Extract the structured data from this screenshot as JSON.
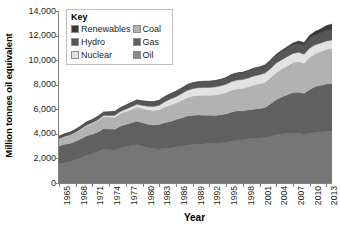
{
  "chart_data": {
    "type": "area",
    "stacked": true,
    "title": "",
    "xlabel": "Year",
    "ylabel": "Million tonnes oil equivalent",
    "xlim": [
      1965,
      2014
    ],
    "ylim": [
      0,
      14000
    ],
    "ytick_step": 2000,
    "ytick_labels": [
      "0",
      "2,000",
      "4,000",
      "6,000",
      "8,000",
      "10,000",
      "12,000",
      "14,000"
    ],
    "ytick_values": [
      0,
      2000,
      4000,
      6000,
      8000,
      10000,
      12000,
      14000
    ],
    "xtick_labels": [
      "1965",
      "1968",
      "1971",
      "1974",
      "1977",
      "1980",
      "1983",
      "1986",
      "1989",
      "1992",
      "1995",
      "1998",
      "2001",
      "2004",
      "2007",
      "2010",
      "2013"
    ],
    "xtick_values": [
      1965,
      1968,
      1971,
      1974,
      1977,
      1980,
      1983,
      1986,
      1989,
      1992,
      1995,
      1998,
      2001,
      2004,
      2007,
      2010,
      2013
    ],
    "grid": false,
    "legend_position": "top-left-inside",
    "x": [
      1965,
      1966,
      1967,
      1968,
      1969,
      1970,
      1971,
      1972,
      1973,
      1974,
      1975,
      1976,
      1977,
      1978,
      1979,
      1980,
      1981,
      1982,
      1983,
      1984,
      1985,
      1986,
      1987,
      1988,
      1989,
      1990,
      1991,
      1992,
      1993,
      1994,
      1995,
      1996,
      1997,
      1998,
      1999,
      2000,
      2001,
      2002,
      2003,
      2004,
      2005,
      2006,
      2007,
      2008,
      2009,
      2010,
      2011,
      2012,
      2013,
      2014
    ],
    "series": [
      {
        "name": "Oil",
        "color": "#767676",
        "stack_order": 1,
        "values": [
          1530,
          1650,
          1760,
          1900,
          2060,
          2250,
          2380,
          2540,
          2750,
          2710,
          2680,
          2860,
          2960,
          3060,
          3120,
          2980,
          2860,
          2780,
          2760,
          2810,
          2820,
          2930,
          2990,
          3080,
          3130,
          3160,
          3170,
          3210,
          3200,
          3260,
          3310,
          3400,
          3490,
          3520,
          3600,
          3640,
          3670,
          3700,
          3780,
          3930,
          3990,
          4030,
          4070,
          4040,
          3960,
          4070,
          4100,
          4150,
          4190,
          4220
        ]
      },
      {
        "name": "Coal",
        "color": "#606060",
        "stack_order": 2,
        "values": [
          1480,
          1500,
          1460,
          1500,
          1550,
          1600,
          1590,
          1610,
          1670,
          1690,
          1700,
          1760,
          1810,
          1840,
          1910,
          1930,
          1930,
          1950,
          2000,
          2100,
          2190,
          2230,
          2300,
          2370,
          2390,
          2380,
          2350,
          2310,
          2290,
          2300,
          2330,
          2370,
          2390,
          2360,
          2340,
          2370,
          2400,
          2450,
          2680,
          2860,
          3010,
          3160,
          3290,
          3350,
          3340,
          3540,
          3760,
          3800,
          3870,
          3880
        ]
      },
      {
        "name": "Gas",
        "color": "#b2b2b2",
        "stack_order": 3,
        "values": [
          570,
          610,
          650,
          700,
          760,
          820,
          880,
          930,
          970,
          980,
          980,
          1030,
          1050,
          1090,
          1150,
          1160,
          1170,
          1180,
          1200,
          1290,
          1340,
          1360,
          1430,
          1490,
          1560,
          1590,
          1630,
          1630,
          1670,
          1690,
          1720,
          1800,
          1800,
          1840,
          1890,
          1980,
          2010,
          2060,
          2130,
          2210,
          2280,
          2350,
          2440,
          2490,
          2440,
          2620,
          2690,
          2760,
          2820,
          2850
        ]
      },
      {
        "name": "Nuclear",
        "color": "#e2e2e2",
        "stack_order": 4,
        "values": [
          20,
          25,
          30,
          35,
          45,
          50,
          60,
          75,
          95,
          110,
          140,
          160,
          190,
          210,
          220,
          240,
          290,
          320,
          360,
          420,
          480,
          510,
          550,
          590,
          600,
          620,
          630,
          630,
          650,
          660,
          670,
          690,
          700,
          700,
          720,
          720,
          730,
          740,
          730,
          760,
          760,
          760,
          750,
          760,
          740,
          760,
          700,
          680,
          680,
          680
        ]
      },
      {
        "name": "Hydro",
        "color": "#565656",
        "stack_order": 5,
        "values": [
          210,
          220,
          230,
          240,
          250,
          260,
          260,
          270,
          280,
          300,
          310,
          310,
          330,
          350,
          360,
          370,
          380,
          390,
          410,
          420,
          430,
          440,
          450,
          460,
          470,
          490,
          490,
          490,
          510,
          510,
          530,
          550,
          550,
          560,
          570,
          590,
          590,
          600,
          620,
          640,
          660,
          680,
          700,
          730,
          750,
          790,
          800,
          830,
          860,
          880
        ]
      },
      {
        "name": "Renewables",
        "color": "#383838",
        "stack_order": 6,
        "values": [
          0,
          0,
          0,
          0,
          0,
          0,
          0,
          0,
          0,
          0,
          0,
          0,
          0,
          0,
          0,
          0,
          0,
          0,
          0,
          0,
          0,
          0,
          0,
          10,
          10,
          10,
          15,
          20,
          25,
          30,
          35,
          40,
          45,
          50,
          55,
          60,
          65,
          75,
          85,
          95,
          110,
          130,
          150,
          180,
          210,
          250,
          300,
          340,
          390,
          440
        ]
      }
    ]
  },
  "legend": {
    "title": "Key",
    "columns": [
      {
        "items": [
          {
            "label": "Renewables",
            "color": "#383838"
          },
          {
            "label": "Hydro",
            "color": "#565656"
          },
          {
            "label": "Nuclear",
            "color": "#e2e2e2"
          }
        ]
      },
      {
        "items": [
          {
            "label": "Coal",
            "color": "#b2b2b2"
          },
          {
            "label": "Gas",
            "color": "#606060"
          },
          {
            "label": "Oil",
            "color": "#8a8a8a"
          }
        ]
      }
    ]
  }
}
